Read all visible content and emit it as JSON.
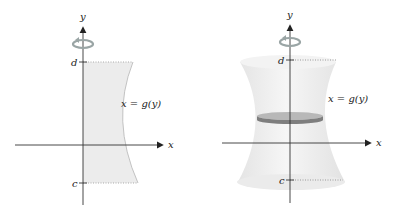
{
  "left_panel": {
    "y_axis_label": "y",
    "x_axis_label": "x",
    "curve_label": "x = g(y)",
    "upper_bound_label": "d",
    "lower_bound_label": "c",
    "rotation_icon": "rotation-arrow-icon"
  },
  "right_panel": {
    "y_axis_label": "y",
    "x_axis_label": "x",
    "curve_label": "x = g(y)",
    "upper_bound_label": "d",
    "lower_bound_label": "c",
    "rotation_icon": "rotation-arrow-icon"
  },
  "colors": {
    "region_fill": "#ececec",
    "solid_fill": "#eeeeee",
    "disk_band": "#8a8a8a",
    "axis": "#333333",
    "dotted": "#999999",
    "rotation_arrow": "#9aa5a5"
  }
}
